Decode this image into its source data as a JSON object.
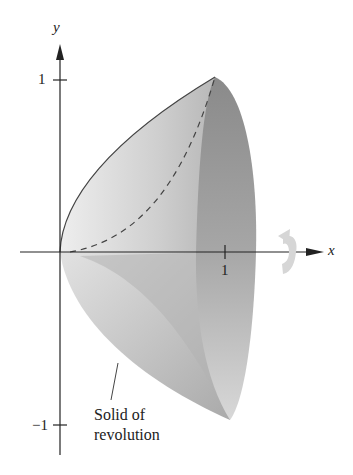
{
  "figure": {
    "axes": {
      "x_label": "x",
      "y_label": "y",
      "x_ticks": [
        {
          "value": 1,
          "label": "1"
        }
      ],
      "y_ticks": [
        {
          "value": 1,
          "label": "1"
        },
        {
          "value": -1,
          "label": "−1"
        }
      ]
    },
    "annotation": {
      "line1": "Solid of",
      "line2": "revolution"
    },
    "icons": [
      "rotation-arrow-icon"
    ],
    "colors": {
      "axis": "#222222",
      "surface_light": "#e4e4e4",
      "surface_mid": "#bdbdbd",
      "surface_dark": "#8f8f8f",
      "rotation_arrow": "#d6d6d6"
    }
  }
}
